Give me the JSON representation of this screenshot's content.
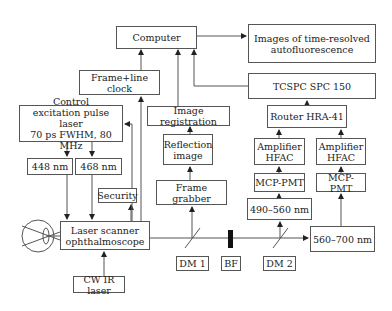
{
  "diagram": {
    "nodes": {
      "computer": "Computer",
      "images": "Images of time-resolved\nautofluorescence",
      "frame_line_clock": "Frame+line clock",
      "tcspc": "TCSPC SPC 150",
      "control": "Control\nexcitation pulse laser\n70 ps FWHM, 80 MHz",
      "image_registration": "Image registration",
      "router": "Router HRA-41",
      "reflection_image": "Reflection\nimage",
      "amp1": "Amplifier\nHFAC",
      "amp2": "Amplifier\nHFAC",
      "nm448": "448 nm",
      "nm468": "468 nm",
      "security": "Security",
      "frame_grabber": "Frame grabber",
      "mcp1": "MCP-PMT",
      "mcp2": "MCP-PMT",
      "nm490_560": "490–560 nm",
      "laser_scanner": "Laser scanner\nophthalmoscope",
      "nm560_700": "560–700 nm",
      "dm1": "DM 1",
      "bf": "BF",
      "dm2": "DM 2",
      "cw_ir_laser": "CW IR laser"
    },
    "colors": {
      "line": "#555555",
      "filter": "#111111"
    }
  }
}
